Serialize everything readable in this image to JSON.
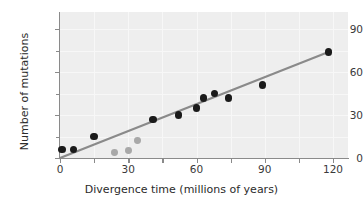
{
  "chart_data": {
    "type": "scatter",
    "title": "",
    "xlabel": "Divergence time (millions of years)",
    "ylabel": "Number of mutations",
    "xlim": [
      0,
      126
    ],
    "ylim": [
      0,
      102
    ],
    "xticks": [
      0,
      30,
      60,
      90,
      120
    ],
    "yticks": [
      0,
      30,
      60,
      90
    ],
    "xticklabels": [
      "0",
      "30",
      "60",
      "90",
      "120"
    ],
    "yticklabels": [
      "0",
      "30",
      "60",
      "90"
    ],
    "x_minor_ticks": [
      15,
      45,
      75,
      105
    ],
    "y_minor_ticks": [
      15,
      45,
      75
    ],
    "grid": true,
    "grid_color": "#f7f7f7",
    "panel_background": "#eeeeee",
    "legend": null,
    "series": [
      {
        "name": "primary",
        "marker": "filled-circle",
        "color": "#1a1a1a",
        "points": [
          {
            "x": 1,
            "y": 6
          },
          {
            "x": 6,
            "y": 6
          },
          {
            "x": 15,
            "y": 15
          },
          {
            "x": 41,
            "y": 27
          },
          {
            "x": 52,
            "y": 30
          },
          {
            "x": 60,
            "y": 35
          },
          {
            "x": 63,
            "y": 42
          },
          {
            "x": 68,
            "y": 45
          },
          {
            "x": 74,
            "y": 42
          },
          {
            "x": 89,
            "y": 51
          },
          {
            "x": 118,
            "y": 74
          }
        ]
      },
      {
        "name": "outliers",
        "marker": "filled-circle",
        "color": "#a8a8a8",
        "points": [
          {
            "x": 24,
            "y": 4
          },
          {
            "x": 30,
            "y": 5
          },
          {
            "x": 34,
            "y": 12
          }
        ]
      }
    ],
    "trendline": {
      "name": "regression-line",
      "color": "#8a8a8a",
      "x0": 0,
      "y0": 0,
      "x1": 118,
      "y1": 74
    }
  },
  "axes": {
    "x_title": "Divergence time (millions of years)",
    "y_title": "Number of mutations"
  }
}
